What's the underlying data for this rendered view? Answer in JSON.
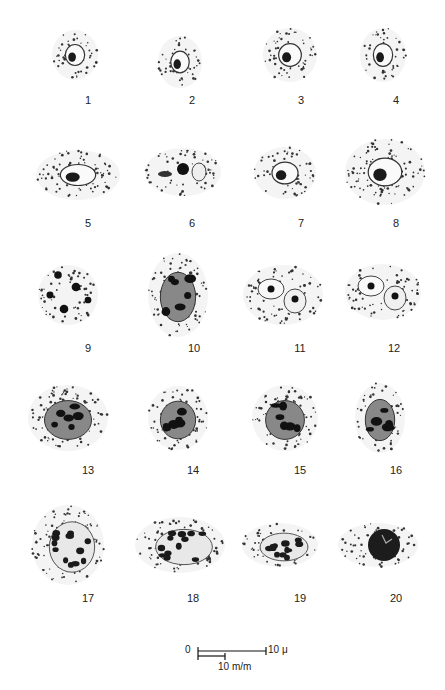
{
  "figure": {
    "type": "illustration-plate",
    "cells": [
      {
        "label": "1",
        "cx": 75,
        "cy": 55,
        "rx": 23,
        "ry": 25,
        "shape": "round",
        "nucleus": "small"
      },
      {
        "label": "2",
        "cx": 180,
        "cy": 62,
        "rx": 22,
        "ry": 26,
        "shape": "round",
        "nucleus": "small"
      },
      {
        "label": "3",
        "cx": 290,
        "cy": 55,
        "rx": 27,
        "ry": 27,
        "shape": "round",
        "nucleus": "small"
      },
      {
        "label": "4",
        "cx": 383,
        "cy": 55,
        "rx": 23,
        "ry": 27,
        "shape": "round",
        "nucleus": "small"
      },
      {
        "label": "5",
        "cx": 78,
        "cy": 175,
        "rx": 42,
        "ry": 25,
        "shape": "oval",
        "nucleus": "ring"
      },
      {
        "label": "6",
        "cx": 183,
        "cy": 172,
        "rx": 38,
        "ry": 24,
        "shape": "oval",
        "nucleus": "lobed"
      },
      {
        "label": "7",
        "cx": 285,
        "cy": 173,
        "rx": 31,
        "ry": 26,
        "shape": "oval",
        "nucleus": "ring"
      },
      {
        "label": "8",
        "cx": 385,
        "cy": 172,
        "rx": 40,
        "ry": 33,
        "shape": "round",
        "nucleus": "ring"
      },
      {
        "label": "9",
        "cx": 68,
        "cy": 295,
        "rx": 30,
        "ry": 30,
        "shape": "round",
        "nucleus": "scattered"
      },
      {
        "label": "10",
        "cx": 178,
        "cy": 295,
        "rx": 30,
        "ry": 42,
        "shape": "double",
        "nucleus": "dense"
      },
      {
        "label": "11",
        "cx": 283,
        "cy": 295,
        "rx": 40,
        "ry": 30,
        "shape": "oval",
        "nucleus": "double"
      },
      {
        "label": "12",
        "cx": 383,
        "cy": 292,
        "rx": 38,
        "ry": 28,
        "shape": "oval",
        "nucleus": "double"
      },
      {
        "label": "13",
        "cx": 68,
        "cy": 418,
        "rx": 40,
        "ry": 33,
        "shape": "oval",
        "nucleus": "dense"
      },
      {
        "label": "14",
        "cx": 178,
        "cy": 418,
        "rx": 30,
        "ry": 32,
        "shape": "round",
        "nucleus": "dense"
      },
      {
        "label": "15",
        "cx": 285,
        "cy": 418,
        "rx": 33,
        "ry": 33,
        "shape": "round",
        "nucleus": "dense"
      },
      {
        "label": "16",
        "cx": 380,
        "cy": 418,
        "rx": 25,
        "ry": 35,
        "shape": "oval",
        "nucleus": "dense"
      },
      {
        "label": "17",
        "cx": 68,
        "cy": 545,
        "rx": 36,
        "ry": 40,
        "shape": "round",
        "nucleus": "granular"
      },
      {
        "label": "18",
        "cx": 180,
        "cy": 545,
        "rx": 45,
        "ry": 28,
        "shape": "oval",
        "nucleus": "granular"
      },
      {
        "label": "19",
        "cx": 280,
        "cy": 545,
        "rx": 38,
        "ry": 22,
        "shape": "oval",
        "nucleus": "granular"
      },
      {
        "label": "20",
        "cx": 378,
        "cy": 545,
        "rx": 40,
        "ry": 22,
        "shape": "oval",
        "nucleus": "solid"
      }
    ],
    "label_positions": [
      {
        "label": "1",
        "x": 88,
        "y": 94
      },
      {
        "label": "2",
        "x": 192,
        "y": 94
      },
      {
        "label": "3",
        "x": 301,
        "y": 94
      },
      {
        "label": "4",
        "x": 396,
        "y": 94
      },
      {
        "label": "5",
        "x": 88,
        "y": 217
      },
      {
        "label": "6",
        "x": 192,
        "y": 217
      },
      {
        "label": "7",
        "x": 301,
        "y": 217
      },
      {
        "label": "8",
        "x": 396,
        "y": 217
      },
      {
        "label": "9",
        "x": 88,
        "y": 342
      },
      {
        "label": "10",
        "x": 194,
        "y": 342
      },
      {
        "label": "11",
        "x": 300,
        "y": 342
      },
      {
        "label": "12",
        "x": 394,
        "y": 342
      },
      {
        "label": "13",
        "x": 88,
        "y": 464
      },
      {
        "label": "14",
        "x": 193,
        "y": 464
      },
      {
        "label": "15",
        "x": 300,
        "y": 464
      },
      {
        "label": "16",
        "x": 396,
        "y": 464
      },
      {
        "label": "17",
        "x": 88,
        "y": 592
      },
      {
        "label": "18",
        "x": 193,
        "y": 592
      },
      {
        "label": "19",
        "x": 300,
        "y": 592
      },
      {
        "label": "20",
        "x": 396,
        "y": 592
      }
    ],
    "scale_bar": {
      "zero_label": "0",
      "micron_label": "10 μ",
      "mm_label": "10 m/m"
    }
  }
}
